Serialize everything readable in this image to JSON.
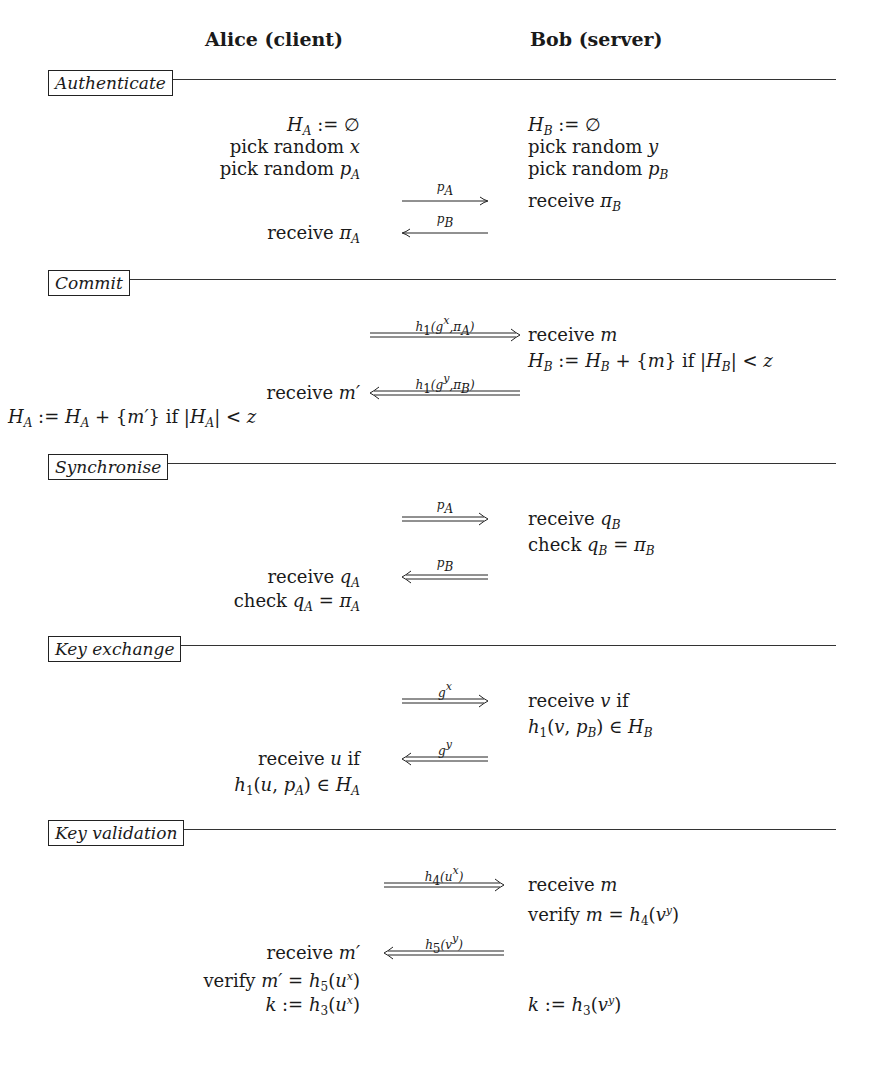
{
  "figure": {
    "parties": {
      "alice": "Alice (client)",
      "bob": "Bob (server)"
    },
    "sections": [
      {
        "title": "Authenticate",
        "steps": [
          {
            "alice": "H_A := ∅",
            "bob": "H_B := ∅"
          },
          {
            "alice": "pick random x",
            "bob": "pick random y"
          },
          {
            "alice": "pick random p_A",
            "bob": "pick random p_B"
          },
          {
            "arrow": {
              "direction": "right",
              "style": "single",
              "label": "p_A"
            },
            "bob": "receive π_B"
          },
          {
            "alice": "receive π_A",
            "arrow": {
              "direction": "left",
              "style": "single",
              "label": "p_B"
            }
          }
        ]
      },
      {
        "title": "Commit",
        "steps": [
          {
            "arrow": {
              "direction": "right",
              "style": "double",
              "label": "h_1(g^x, π_A)"
            },
            "bob": "receive m"
          },
          {
            "bob": "H_B := H_B + {m} if |H_B| < z"
          },
          {
            "alice": "receive m′",
            "arrow": {
              "direction": "left",
              "style": "double",
              "label": "h_1(g^y, π_B)"
            }
          },
          {
            "alice": "H_A := H_A + {m′} if |H_A| < z"
          }
        ]
      },
      {
        "title": "Synchronise",
        "steps": [
          {
            "arrow": {
              "direction": "right",
              "style": "double",
              "label": "p_A"
            },
            "bob": "receive q_B"
          },
          {
            "bob": "check q_B = π_B"
          },
          {
            "alice": "receive q_A",
            "arrow": {
              "direction": "left",
              "style": "double",
              "label": "p_B"
            }
          },
          {
            "alice": "check q_A = π_A"
          }
        ]
      },
      {
        "title": "Key exchange",
        "steps": [
          {
            "arrow": {
              "direction": "right",
              "style": "double",
              "label": "g^x"
            },
            "bob": "receive v if"
          },
          {
            "bob": "h_1(v, p_B) ∈ H_B"
          },
          {
            "alice": "receive u if",
            "arrow": {
              "direction": "left",
              "style": "double",
              "label": "g^y"
            }
          },
          {
            "alice": "h_1(u, p_A) ∈ H_A"
          }
        ]
      },
      {
        "title": "Key validation",
        "steps": [
          {
            "arrow": {
              "direction": "right",
              "style": "double",
              "label": "h_4(u^x)"
            },
            "bob": "receive m"
          },
          {
            "bob": "verify m = h_4(v^y)"
          },
          {
            "alice": "receive m′",
            "arrow": {
              "direction": "left",
              "style": "double",
              "label": "h_5(v^y)"
            }
          },
          {
            "alice": "verify m′ = h_5(u^x)"
          },
          {
            "alice": "k := h_3(u^x)",
            "bob": "k := h_3(v^y)"
          }
        ]
      }
    ],
    "labels": {
      "s0_a0": "H",
      "s0_b0": "H",
      "empty": "∅",
      "assign": ":=",
      "pick": "pick random",
      "receive": "receive",
      "check": "check",
      "verify": "verify",
      "if": "if"
    }
  }
}
